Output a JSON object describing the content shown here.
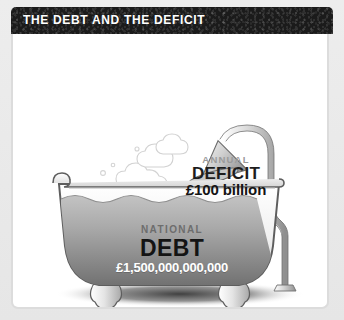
{
  "header": {
    "title": "THE DEBT AND THE DEFICIT",
    "bar_color": "#1b1b1b",
    "title_color": "#ffffff"
  },
  "panel": {
    "background_color": "#ffffff",
    "border_color": "#dcdcdc"
  },
  "illustration": {
    "name": "bathtub-filling-with-debt",
    "shower": {
      "name": "showerhead",
      "spray_stream_count": 6,
      "pipe_color": "#8e8e8e"
    },
    "steam": {
      "name": "steam-clouds",
      "color": "#d8d8d8",
      "bubble_count": 5
    },
    "tub": {
      "name": "clawfoot-bathtub",
      "body_color": "#f2f2f2",
      "outline_color": "#5e5e5e",
      "water_color_top": "#b9b9b9",
      "water_color_bottom": "#7e7e7e",
      "foot_count": 2
    },
    "floor_shadow_color": "#2a2a2a"
  },
  "labels": {
    "deficit": {
      "line1": "ANNUAL",
      "line2": "DEFICIT",
      "amount": "£100 billion",
      "line1_color": "#9a9a9a",
      "line2_color": "#1d1d1d",
      "amount_color": "#141414"
    },
    "debt": {
      "line1": "NATIONAL",
      "line2": "DEBT",
      "amount": "£1,500,000,000,000",
      "line1_color": "#6d6d6d",
      "line2_color": "#141414",
      "amount_color": "#ffffff"
    }
  }
}
